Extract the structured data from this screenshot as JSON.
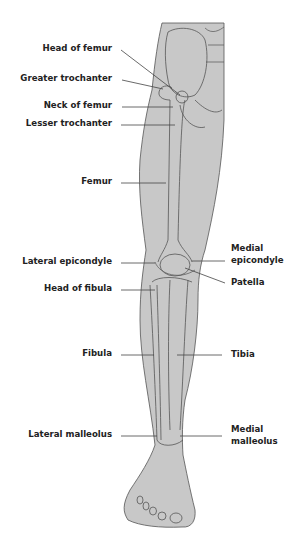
{
  "diagram": {
    "labels_left": [
      {
        "id": "head-of-femur",
        "text": "Head of femur"
      },
      {
        "id": "greater-trochanter",
        "text": "Greater trochanter"
      },
      {
        "id": "neck-of-femur",
        "text": "Neck of femur"
      },
      {
        "id": "lesser-trochanter",
        "text": "Lesser trochanter"
      },
      {
        "id": "femur",
        "text": "Femur"
      },
      {
        "id": "lateral-epicondyle",
        "text": "Lateral epicondyle"
      },
      {
        "id": "head-of-fibula",
        "text": "Head of fibula"
      },
      {
        "id": "fibula",
        "text": "Fibula"
      },
      {
        "id": "lateral-malleolus",
        "text": "Lateral malleolus"
      }
    ],
    "labels_right": [
      {
        "id": "medial-epicondyle",
        "line1": "Medial",
        "line2": "epicondyle"
      },
      {
        "id": "patella",
        "text": "Patella"
      },
      {
        "id": "tibia",
        "text": "Tibia"
      },
      {
        "id": "medial-malleolus",
        "line1": "Medial",
        "line2": "malleolus"
      }
    ],
    "colors": {
      "leg_fill": "#c8c8c8",
      "outline": "#555555",
      "leader": "#444444",
      "text": "#222222"
    }
  }
}
